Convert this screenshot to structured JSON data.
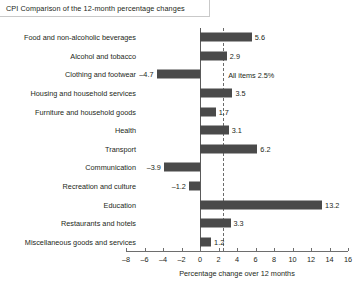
{
  "chart_data": {
    "type": "bar",
    "orientation": "horizontal",
    "title": "CPI Comparison of the 12-month percentage changes",
    "xlabel": "Percentage change over 12 months",
    "ylabel": "",
    "xlim": [
      -8,
      16
    ],
    "xticks": [
      -8,
      -6,
      -4,
      -2,
      0,
      2,
      4,
      6,
      8,
      10,
      12,
      14,
      16
    ],
    "xtick_labels": [
      "–8",
      "–6",
      "–4",
      "–2",
      "0",
      "2",
      "4",
      "6",
      "8",
      "10",
      "12",
      "14",
      "16"
    ],
    "grid": false,
    "legend": false,
    "bar_color": "#4a4a4a",
    "reference_line": {
      "value": 2.5,
      "style": "dashed",
      "label": "All items 2.5%"
    },
    "categories": [
      "Food and non-alcoholic beverages",
      "Alcohol and tobacco",
      "Clothing and footwear",
      "Housing and household services",
      "Furniture and household goods",
      "Health",
      "Transport",
      "Communication",
      "Recreation and culture",
      "Education",
      "Restaurants and hotels",
      "Miscellaneous goods and services"
    ],
    "values": [
      5.6,
      2.9,
      -4.7,
      3.5,
      1.7,
      3.1,
      6.2,
      -3.9,
      -1.2,
      13.2,
      3.3,
      1.2
    ],
    "value_labels": [
      "5.6",
      "2.9",
      "–4.7",
      "3.5",
      "1.7",
      "3.1",
      "6.2",
      "–3.9",
      "–1.2",
      "13.2",
      "3.3",
      "1.2"
    ]
  }
}
